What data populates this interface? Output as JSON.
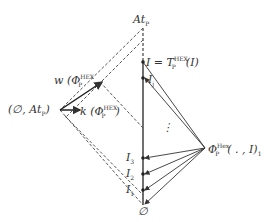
{
  "diagram": {
    "labels": {
      "top": "At_P",
      "top_main": "At",
      "top_sub": "P",
      "fixpoint_main": "I = T",
      "fixpoint_sup": "HEX",
      "fixpoint_sub": "P",
      "fixpoint_tail": "(I)",
      "ij": "I",
      "ij_sub": "j",
      "left_node": "(∅, At",
      "left_node_sub": "P",
      "left_node_tail": ")",
      "w_label": "w (Φ",
      "w_sup": "HEX",
      "w_sub": "P",
      "k_label": "k (Φ",
      "k_sup": "HEX",
      "k_sub": "P",
      "k_tail": ")",
      "phi_main": "Φ",
      "phi_sup": "Hex",
      "phi_sub": "P",
      "phi_tail": "( . , I)",
      "phi_tail_sub": "1",
      "dots": "⋮",
      "i3": "I",
      "i3_sub": "3",
      "i2": "I",
      "i2_sub": "2",
      "i1": "I",
      "i1_sub": "1",
      "bottom": "∅"
    },
    "colors": {
      "line": "#333333",
      "dashed": "#555555"
    }
  }
}
